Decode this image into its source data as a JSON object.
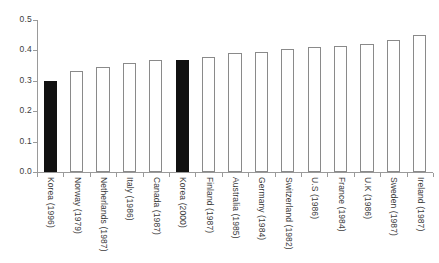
{
  "chart_data": {
    "type": "bar",
    "title": "",
    "subtitle": "",
    "xlabel": "",
    "ylabel": "",
    "ylim": [
      0.0,
      0.5
    ],
    "yticks": [
      "0.0",
      "0.1",
      "0.2",
      "0.3",
      "0.4",
      "0.5"
    ],
    "ytick_values": [
      0.0,
      0.1,
      0.2,
      0.3,
      0.4,
      0.5
    ],
    "grid": false,
    "legend": "none",
    "categories": [
      "Korea (1996)",
      "Norway (1979)",
      "Netherlands (1987)",
      "Italy (1986)",
      "Canada (1987)",
      "Korea (2000)",
      "Finland (1987)",
      "Australia (1985)",
      "Germany (1984)",
      "Switzerland (1982)",
      "U.S (1986)",
      "France (1984)",
      "U.K (1986)",
      "Sweden (1987)",
      "Ireland (1987)"
    ],
    "values": [
      0.3,
      0.333,
      0.345,
      0.36,
      0.37,
      0.37,
      0.377,
      0.39,
      0.395,
      0.405,
      0.41,
      0.415,
      0.42,
      0.435,
      0.45
    ],
    "highlighted_indices": [
      0,
      5
    ],
    "colors": {
      "bar_fill": "#ffffff",
      "bar_edge": "#8a8a8a",
      "highlight_fill": "#111111",
      "axis": "#9a9a9a",
      "text": "#3c3c3c",
      "background": "#ffffff"
    }
  }
}
